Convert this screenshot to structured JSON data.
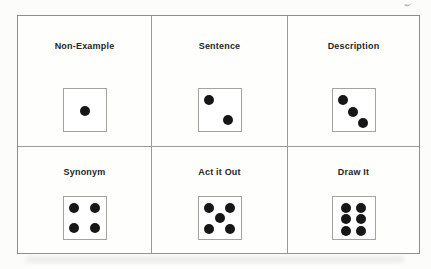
{
  "page": {
    "background_color": "#fcfcfb",
    "table_border_color": "#8e8e8c",
    "grid_line_color": "#9b9b99",
    "die_border_color": "#a2a29e",
    "pip_color": "#161616",
    "label_color": "#262626"
  },
  "table": {
    "rows": 2,
    "columns": 3,
    "cells": [
      {
        "label": "Non-Example",
        "die": 1
      },
      {
        "label": "Sentence",
        "die": 2
      },
      {
        "label": "Description",
        "die": 3
      },
      {
        "label": "Synonym",
        "die": 4
      },
      {
        "label": "Act it Out",
        "die": 5
      },
      {
        "label": "Draw It",
        "die": 6
      }
    ]
  },
  "dice_patterns": {
    "1": [
      [
        50,
        52
      ]
    ],
    "2": [
      [
        26,
        25
      ],
      [
        70,
        74
      ]
    ],
    "3": [
      [
        25,
        26
      ],
      [
        49,
        54
      ],
      [
        73,
        80
      ]
    ],
    "4": [
      [
        26,
        26
      ],
      [
        74,
        26
      ],
      [
        26,
        74
      ],
      [
        74,
        74
      ]
    ],
    "5": [
      [
        26,
        25
      ],
      [
        74,
        25
      ],
      [
        50,
        50
      ],
      [
        26,
        75
      ],
      [
        74,
        75
      ]
    ],
    "6": [
      [
        31,
        26
      ],
      [
        69,
        26
      ],
      [
        31,
        53
      ],
      [
        69,
        53
      ],
      [
        31,
        80
      ],
      [
        69,
        80
      ]
    ]
  }
}
